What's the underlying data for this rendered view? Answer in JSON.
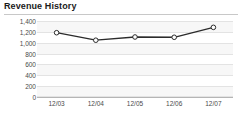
{
  "card": {
    "title": "Revenue History"
  },
  "chart_data": {
    "type": "line",
    "title": "Revenue History",
    "xlabel": "",
    "ylabel": "",
    "categories": [
      "12/03",
      "12/04",
      "12/05",
      "12/06",
      "12/07"
    ],
    "values": [
      1200,
      1060,
      1120,
      1115,
      1300
    ],
    "series": [
      {
        "name": "Revenue",
        "values": [
          1200,
          1060,
          1120,
          1115,
          1300
        ]
      }
    ],
    "ylim": [
      0,
      1400
    ],
    "ytick_labels": [
      "1,400",
      "1,200",
      "1,000",
      "800",
      "600",
      "400",
      "200",
      "0"
    ],
    "ytick_values": [
      1400,
      1200,
      1000,
      800,
      600,
      400,
      200,
      0
    ],
    "grid": true,
    "legend": false,
    "line_color": "#2b2b2b",
    "marker_fill": "#ffffff",
    "marker_stroke": "#2b2b2b",
    "plot_background": "#f7f7f7",
    "band_color": "#ffffff"
  }
}
